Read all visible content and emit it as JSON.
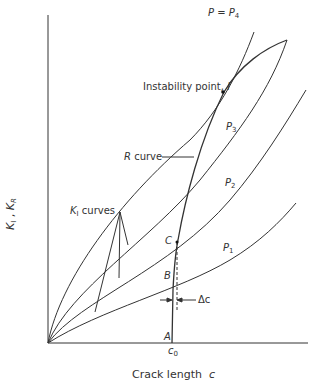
{
  "figure": {
    "y_axis_label": {
      "main": "K",
      "sub1": "I",
      "sep": " , ",
      "main2": "K",
      "sub2": "R"
    },
    "x_axis_label": {
      "text": "Crack length",
      "var": "c"
    },
    "x_tick": {
      "main": "c",
      "sub": "0"
    },
    "labels": {
      "p4": {
        "lhs": "P",
        "eq": " = ",
        "main": "P",
        "sub": "4"
      },
      "p3": {
        "main": "P",
        "sub": "3"
      },
      "p2": {
        "main": "P",
        "sub": "2"
      },
      "p1": {
        "main": "P",
        "sub": "1"
      },
      "instability": {
        "text": "Instability point,",
        "var": "I"
      },
      "r_curve": {
        "var": "R",
        "text": " curve"
      },
      "k1_curves": {
        "main": "K",
        "sub": "I",
        "text": " curves"
      },
      "point_a": "A",
      "point_b": "B",
      "point_c": "C",
      "delta_c": "Δc"
    },
    "colors": {
      "line": "#333333",
      "background": "#ffffff"
    }
  }
}
